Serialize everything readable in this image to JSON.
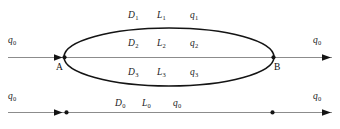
{
  "figure": {
    "type": "parallel-branch-flow-diagram",
    "background_color": "#ffffff",
    "ellipse_stroke_color": "#141414",
    "axis_line_color": "#8c8c8c",
    "text_color": "#1a1a1a"
  },
  "nodes": {
    "a_label": "A",
    "b_label": "B"
  },
  "flows": {
    "inlet_label": "q",
    "inlet_sub": "0",
    "outlet_label": "q",
    "outlet_sub": "0",
    "bottom_inlet_label": "q",
    "bottom_inlet_sub": "0",
    "bottom_outlet_label": "q",
    "bottom_outlet_sub": "0"
  },
  "branches": [
    {
      "d_label": "D",
      "d_sub": "1",
      "l_label": "L",
      "l_sub": "1",
      "q_label": "q",
      "q_sub": "1"
    },
    {
      "d_label": "D",
      "d_sub": "2",
      "l_label": "L",
      "l_sub": "2",
      "q_label": "q",
      "q_sub": "2"
    },
    {
      "d_label": "D",
      "d_sub": "3",
      "l_label": "L",
      "l_sub": "3",
      "q_label": "q",
      "q_sub": "3"
    }
  ],
  "equivalent_branch": {
    "d_label": "D",
    "d_sub": "0",
    "l_label": "L",
    "l_sub": "0",
    "q_label": "q",
    "q_sub": "0"
  }
}
